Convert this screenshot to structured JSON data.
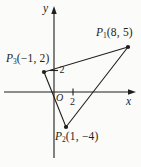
{
  "figure": {
    "bg_color": "#fbfbf9",
    "line_color": "#1e1e1c",
    "axes": {
      "x_label": "x",
      "y_label": "y",
      "origin_label": "O",
      "x_tick_value": "2",
      "y_tick_value": "2"
    },
    "points": [
      {
        "id": "P1",
        "name": "P",
        "sub": "1",
        "coords": "(8, 5)",
        "math_x": 8,
        "math_y": 5,
        "px": [
          128,
          47
        ]
      },
      {
        "id": "P2",
        "name": "P",
        "sub": "2",
        "coords": "(1, −4)",
        "math_x": 1,
        "math_y": -4,
        "px": [
          66,
          127
        ]
      },
      {
        "id": "P3",
        "name": "P",
        "sub": "3",
        "coords": "(−1, 2)",
        "math_x": -1,
        "math_y": 2,
        "px": [
          44,
          72
        ]
      }
    ]
  }
}
